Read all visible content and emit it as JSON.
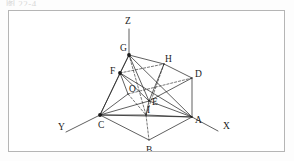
{
  "page": {
    "top_caption": "图 22-4",
    "background_color": "#fdfdfd",
    "frame_color": "#b5b5b5",
    "ink_color": "#1b1b1b"
  },
  "figure": {
    "type": "3d-geometry-diagram",
    "axes": [
      {
        "name": "x-axis",
        "label": "X",
        "label_x": 214,
        "label_y": 118,
        "from": [
          183,
          106
        ],
        "to": [
          209,
          120
        ]
      },
      {
        "name": "y-axis",
        "label": "Y",
        "label_x": 49,
        "label_y": 119,
        "from": [
          91,
          104
        ],
        "to": [
          57,
          121
        ]
      },
      {
        "name": "z-axis",
        "label": "Z",
        "label_x": 116,
        "label_y": 13,
        "from": [
          120,
          44
        ],
        "to": [
          120,
          18
        ]
      }
    ],
    "vertices": [
      {
        "id": "A",
        "label": "A",
        "x": 183,
        "y": 106,
        "label_x": 186,
        "label_y": 112,
        "dot": false
      },
      {
        "id": "B",
        "label": "B",
        "x": 140,
        "y": 129,
        "label_x": 137,
        "label_y": 142,
        "dot": false
      },
      {
        "id": "C",
        "label": "C",
        "x": 91,
        "y": 104,
        "label_x": 89,
        "label_y": 117,
        "dot": true
      },
      {
        "id": "D",
        "label": "D",
        "x": 183,
        "y": 67,
        "label_x": 186,
        "label_y": 66,
        "dot": false
      },
      {
        "id": "E",
        "label": "E",
        "x": 140,
        "y": 90,
        "label_x": 143,
        "label_y": 94,
        "dot": false
      },
      {
        "id": "F",
        "label": "F",
        "x": 111,
        "y": 62,
        "label_x": 101,
        "label_y": 63,
        "dot": true
      },
      {
        "id": "G",
        "label": "G",
        "x": 120,
        "y": 44,
        "label_x": 111,
        "label_y": 40,
        "dot": true
      },
      {
        "id": "H",
        "label": "H",
        "x": 155,
        "y": 53,
        "label_x": 156,
        "label_y": 51,
        "dot": false
      },
      {
        "id": "I",
        "label": "I",
        "x": 137,
        "y": 104,
        "label_x": 138,
        "label_y": 102,
        "dot": false
      },
      {
        "id": "O",
        "label": "O",
        "x": 119,
        "y": 83,
        "label_x": 120,
        "label_y": 81,
        "dot": false
      }
    ],
    "solid_edges": [
      [
        "F",
        "G"
      ],
      [
        "G",
        "H"
      ],
      [
        "H",
        "D"
      ],
      [
        "F",
        "O"
      ],
      [
        "O",
        "C"
      ],
      [
        "C",
        "B"
      ],
      [
        "B",
        "A"
      ],
      [
        "A",
        "D"
      ],
      [
        "C",
        "A"
      ],
      [
        "F",
        "C"
      ],
      [
        "D",
        "E"
      ],
      [
        "E",
        "A"
      ],
      [
        "G",
        "F"
      ],
      [
        "G",
        "C"
      ],
      [
        "G",
        "E"
      ],
      [
        "G",
        "A"
      ],
      [
        "F",
        "E"
      ],
      [
        "F",
        "A"
      ],
      [
        "C",
        "E"
      ],
      [
        "E",
        "I"
      ],
      [
        "I",
        "C"
      ],
      [
        "I",
        "A"
      ],
      [
        "H",
        "E"
      ]
    ],
    "dashed_edges": [
      [
        "F",
        "H"
      ],
      [
        "O",
        "E"
      ],
      [
        "O",
        "I"
      ],
      [
        "G",
        "I"
      ],
      [
        "I",
        "B"
      ],
      [
        "H",
        "I"
      ]
    ]
  }
}
